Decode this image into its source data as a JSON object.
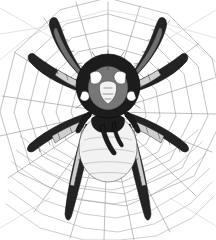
{
  "artwork": {
    "title": "Orb-weaver spider on web",
    "subject": "spider",
    "setting": "spider-web",
    "style": "vintage engraving line art",
    "medium": "black ink hatching on white",
    "orientation": "portrait",
    "background_color": "#ffffff",
    "palette": {
      "background": "#ffffff",
      "web_line": "#9a9a9a",
      "web_line_faint": "#c4c4c4",
      "ink_darkest": "#111111",
      "ink_dark": "#232323",
      "ink_mid": "#6e6e6e",
      "ink_light": "#cfcfcf",
      "highlight": "#ffffff"
    },
    "canvas": {
      "width": 216,
      "height": 240
    }
  },
  "web": {
    "name": "orb-web",
    "hub": {
      "x": 108,
      "y": 112
    },
    "radial_count": 18,
    "spiral_rings": 11,
    "line_color": "#9a9a9a",
    "line_color_faint": "#c4c4c4",
    "description": "radial spokes converging behind the spider with concentric polygonal spiral threads"
  },
  "spider": {
    "name": "orb-weaver",
    "center": {
      "x": 108,
      "y": 104
    },
    "leg_count": 8,
    "parts": {
      "cephalothorax": "dark shield with paired white oval markings",
      "abdomen": "pale rounded abdomen with faint segment contours",
      "chelicerae": "dark downward fangs",
      "pedipalps": "short dark paired appendages"
    },
    "legs": [
      {
        "id": "left-front-1",
        "direction": "up-left",
        "shade": "dark"
      },
      {
        "id": "left-front-2",
        "direction": "left-upper",
        "shade": "banded"
      },
      {
        "id": "left-rear-3",
        "direction": "left-lower",
        "shade": "banded"
      },
      {
        "id": "left-rear-4",
        "direction": "down-left",
        "shade": "dark"
      },
      {
        "id": "right-front-1",
        "direction": "up-right",
        "shade": "dark"
      },
      {
        "id": "right-front-2",
        "direction": "right-upper",
        "shade": "banded"
      },
      {
        "id": "right-rear-3",
        "direction": "right-lower",
        "shade": "banded"
      },
      {
        "id": "right-rear-4",
        "direction": "down-right",
        "shade": "dark"
      }
    ]
  }
}
